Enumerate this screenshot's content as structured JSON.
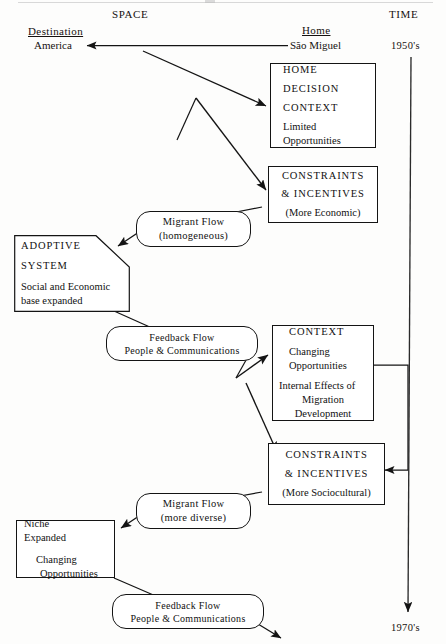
{
  "diagram": {
    "headers": {
      "space": "SPACE",
      "time": "TIME",
      "destination": "Destination",
      "home": "Home"
    },
    "places": {
      "origin": "São Miguel",
      "destination": "America"
    },
    "timeline": {
      "start": "1950's",
      "end": "1970's"
    },
    "boxes": {
      "home_decision": {
        "line1": "HOME",
        "line2": "DECISION",
        "line3": "CONTEXT",
        "line4": "Limited",
        "line5": "Opportunities"
      },
      "constraints_economic": {
        "line1": "CONSTRAINTS",
        "line2": "& INCENTIVES",
        "line3": "(More Economic)"
      },
      "adoptive_system": {
        "line1": "ADOPTIVE",
        "line2": "SYSTEM",
        "line3": "Social and Economic",
        "line4": "base expanded"
      },
      "context_changing": {
        "line1": "CONTEXT",
        "line2": "Changing",
        "line3": "Opportunities",
        "line4": "Internal   Effects of",
        "line5": "Migration",
        "line6": "Development"
      },
      "constraints_sociocultural": {
        "line1": "CONSTRAINTS",
        "line2": "& INCENTIVES",
        "line3": "(More Sociocultural)"
      },
      "niche_expanded": {
        "line1": "Niche",
        "line2": "Expanded",
        "line3": "Changing",
        "line4": "Opportunities"
      }
    },
    "flows": {
      "migrant_homogeneous": {
        "line1": "Migrant Flow",
        "line2": "(homogeneous)"
      },
      "feedback_upper": {
        "line1": "Feedback Flow",
        "line2": "People & Communications"
      },
      "migrant_diverse": {
        "line1": "Migrant Flow",
        "line2": "(more diverse)"
      },
      "feedback_lower": {
        "line1": "Feedback Flow",
        "line2": "People & Communications"
      }
    },
    "colors": {
      "ink": "#141414",
      "paper": "#fdfdfc",
      "timeline_axis": "#2b2b2b"
    }
  }
}
